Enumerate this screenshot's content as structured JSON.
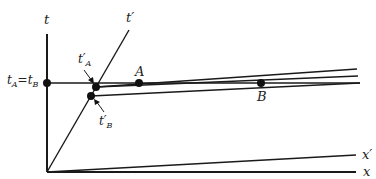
{
  "diagram": {
    "axes": {
      "t": "t",
      "t_prime": "t′",
      "x": "x",
      "x_prime": "x′"
    },
    "labels": {
      "tA_eq_tB": {
        "t1": "t",
        "s1": "A",
        "eq": "=",
        "t2": "t",
        "s2": "B"
      },
      "tA_prime": {
        "t": "t′",
        "s": "A"
      },
      "tB_prime": {
        "t": "t′",
        "s": "B"
      },
      "A": "A",
      "B": "B"
    },
    "colors": {
      "line": "#1a1a1a",
      "background": "#ffffff"
    }
  }
}
